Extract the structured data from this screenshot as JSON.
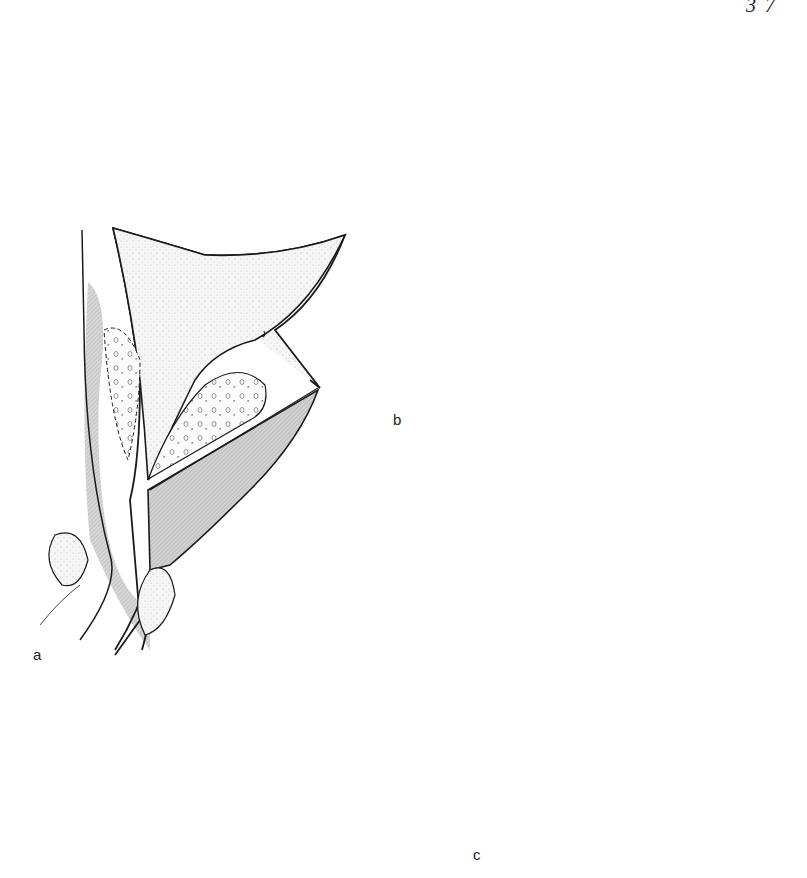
{
  "page": {
    "page_number_fragment": "3 7"
  },
  "figure": {
    "panels": [
      {
        "id": "a",
        "label": "a",
        "lesion": "small nodules (dotted)"
      },
      {
        "id": "b",
        "label": "b",
        "lesion": "fibrous meshwork nodules"
      },
      {
        "id": "c",
        "label": "c",
        "lesion": "large lobulated adenoma"
      }
    ],
    "arrows": {
      "from": "a",
      "to": [
        "b",
        "c"
      ]
    },
    "colors": {
      "outline": "#1a1a1a",
      "stipple": "#e6e6e6",
      "hatch": "#bdbdbd",
      "background": "#ffffff"
    }
  }
}
